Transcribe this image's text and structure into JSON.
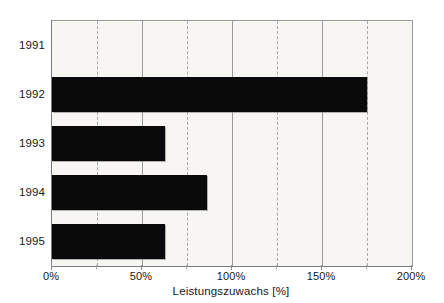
{
  "chart_data": {
    "type": "bar",
    "orientation": "horizontal",
    "title": "",
    "subtitle": "",
    "categories": [
      "1991",
      "1992",
      "1993",
      "1994",
      "1995"
    ],
    "values": [
      0,
      175,
      63,
      86,
      63
    ],
    "series": [
      {
        "name": "Leistungszuwachs",
        "values": [
          0,
          175,
          63,
          86,
          63
        ]
      }
    ],
    "xlabel": "Leistungszuwachs [%]",
    "ylabel": "",
    "xlim": [
      0,
      200
    ],
    "xticks": [
      0,
      50,
      100,
      150,
      200
    ],
    "xtick_labels": [
      "0%",
      "50%",
      "100%",
      "150%",
      "200%"
    ],
    "minor_gridlines": [
      25,
      75,
      125,
      175
    ],
    "major_gridlines": [
      50,
      100,
      150
    ],
    "grid": true,
    "legend": "none",
    "bar_color": "#0a0a0a",
    "plot_background": "#f7f6f2",
    "axis_color": "#8d8d8d",
    "text_color": "#181818"
  },
  "axis": {
    "x_title": "Leistungszuwachs [%]"
  }
}
